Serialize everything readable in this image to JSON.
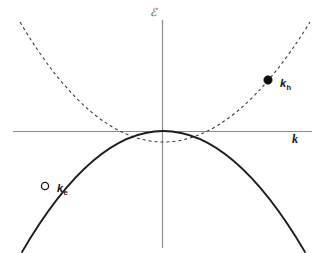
{
  "figure": {
    "background_color": "#ffffff",
    "width": 323,
    "height": 253
  },
  "axes": {
    "energy": {
      "label": "ℰ",
      "name": "energy-axis",
      "color": "#8c8c92",
      "orientation": "vertical",
      "x": 162,
      "y_top": 20,
      "y_bottom": 248
    },
    "wavevector": {
      "label": "k",
      "name": "k-axis",
      "color": "#8c8c92",
      "orientation": "horizontal",
      "y": 131,
      "x_left": 13,
      "x_right": 312
    },
    "origin": {
      "x": 162,
      "y": 131
    }
  },
  "curves": [
    {
      "name": "conduction-band",
      "style": "dashed",
      "color": "#3c3c42",
      "stroke_width": 1.1,
      "dash_pattern": "3 3",
      "curvature": "upward",
      "description": "Conduction band parabola, minimum at origin",
      "path": "M 20 22 Q 162 262 310 22"
    },
    {
      "name": "valence-band",
      "style": "solid",
      "color": "#1c1c20",
      "stroke_width": 1.8,
      "dash_pattern": "none",
      "curvature": "downward",
      "description": "Valence band parabola, maximum at origin",
      "path": "M 22 252 Q 163 10 305 252"
    }
  ],
  "markers": [
    {
      "name": "hole-state-marker",
      "label": "k",
      "subscript": "h",
      "fill": "filled",
      "color": "#0d0d0d",
      "x": 268,
      "y": 80,
      "radius": 4.2,
      "on_curve": "conduction-band"
    },
    {
      "name": "electron-state-marker",
      "label": "k",
      "subscript": "e",
      "fill": "hollow",
      "color": "#1c1c20",
      "x": 45,
      "y": 186,
      "radius": 3.6,
      "on_curve": "valence-band"
    }
  ],
  "chart_data": {
    "type": "line",
    "title": "",
    "xlabel": "k",
    "ylabel": "ℰ",
    "grid": false,
    "legend": "none",
    "axis_origin_label": "0",
    "xlim": [
      -1.05,
      1.1
    ],
    "ylim": [
      -1.15,
      0.82
    ],
    "series": [
      {
        "name": "conduction-band",
        "display_label": "ℰ_c(k)",
        "style": "dashed",
        "color": "#3c3c42",
        "x": [
          -1.05,
          -0.9,
          -0.75,
          -0.6,
          -0.45,
          -0.3,
          -0.15,
          0.0,
          0.15,
          0.3,
          0.45,
          0.6,
          0.75,
          0.9,
          1.05
        ],
        "values": [
          0.8,
          0.59,
          0.41,
          0.26,
          0.15,
          0.066,
          0.016,
          0.0,
          0.016,
          0.066,
          0.15,
          0.26,
          0.41,
          0.59,
          0.8
        ]
      },
      {
        "name": "valence-band",
        "display_label": "ℰ_v(k)",
        "style": "solid",
        "color": "#1c1c20",
        "x": [
          -1.0,
          -0.85,
          -0.7,
          -0.55,
          -0.4,
          -0.25,
          -0.1,
          0.0,
          0.1,
          0.25,
          0.4,
          0.55,
          0.7,
          0.85,
          1.0
        ],
        "values": [
          -1.13,
          -0.82,
          -0.55,
          -0.34,
          -0.18,
          -0.071,
          -0.011,
          0.0,
          -0.011,
          -0.071,
          -0.18,
          -0.34,
          -0.55,
          -0.82,
          -1.13
        ]
      }
    ],
    "annotated_points": [
      {
        "label": "k_h",
        "series": "conduction-band",
        "x": 0.75,
        "y": 0.41,
        "marker": "filled-circle"
      },
      {
        "label": "k_e",
        "series": "valence-band",
        "x": -0.82,
        "y": -0.76,
        "marker": "open-circle"
      }
    ]
  }
}
